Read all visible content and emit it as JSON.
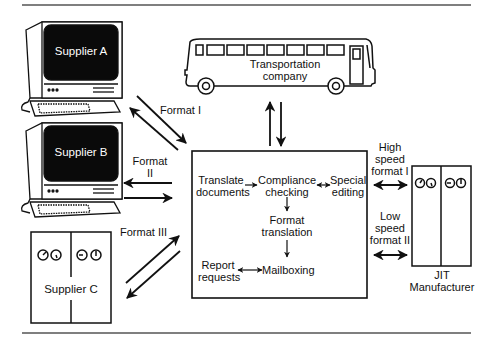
{
  "diagram": {
    "type": "EDI workflow diagram",
    "colors": {
      "stroke": "#111111",
      "background": "#ffffff",
      "screen": "#0a0a0a",
      "screen_text": "#ffffff",
      "rule": "#555555"
    }
  },
  "nodes": {
    "supplier_a": {
      "label": "Supplier A",
      "kind": "computer-terminal"
    },
    "supplier_b": {
      "label": "Supplier B",
      "kind": "computer-terminal"
    },
    "supplier_c": {
      "label": "Supplier C",
      "kind": "equipment-cabinet"
    },
    "transport": {
      "label_line1": "Transportation",
      "label_line2": "company",
      "kind": "bus"
    },
    "jit": {
      "label_line1": "JIT",
      "label_line2": "Manufacturer",
      "kind": "equipment-cabinet"
    },
    "hub": {
      "kind": "processing-box",
      "steps": {
        "translate": {
          "line1": "Translate",
          "line2": "documents"
        },
        "compliance": {
          "line1": "Compliance",
          "line2": "checking"
        },
        "special": {
          "line1": "Special",
          "line2": "editing"
        },
        "format": {
          "line1": "Format",
          "line2": "translation"
        },
        "report": {
          "line1": "Report",
          "line2": "requests"
        },
        "mailbox": {
          "line1": "Mailboxing"
        }
      }
    }
  },
  "edges": {
    "supplier_a": {
      "line1": "Format I"
    },
    "supplier_b": {
      "line1": "Format",
      "line2": "II"
    },
    "supplier_c": {
      "line1": "Format III"
    },
    "jit_high": {
      "line1": "High",
      "line2": "speed",
      "line3": "format I"
    },
    "jit_low": {
      "line1": "Low",
      "line2": "speed",
      "line3": "format II"
    }
  }
}
